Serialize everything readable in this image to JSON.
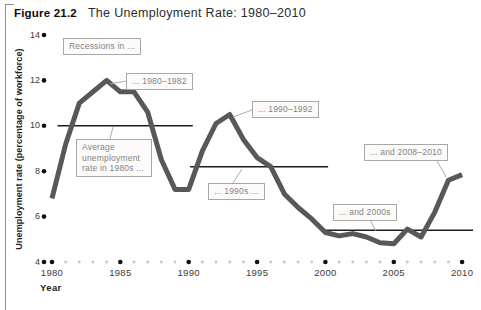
{
  "figure": {
    "label": "Figure 21.2",
    "title": "The Unemployment Rate: 1980–2010"
  },
  "axes": {
    "y_label": "Unemployment rate (percentage of workforce)",
    "x_label": "Year",
    "y_ticks": [
      14,
      12,
      10,
      8,
      6,
      4
    ],
    "x_ticks": [
      1980,
      1985,
      1990,
      1995,
      2000,
      2005,
      2010
    ]
  },
  "chart_data": {
    "type": "line",
    "title": "The Unemployment Rate: 1980–2010",
    "xlabel": "Year",
    "ylabel": "Unemployment rate (percentage of workforce)",
    "xlim": [
      1980,
      2010
    ],
    "ylim": [
      4,
      14
    ],
    "grid": false,
    "x": [
      1980,
      1981,
      1982,
      1983,
      1984,
      1985,
      1986,
      1987,
      1988,
      1989,
      1990,
      1991,
      1992,
      1993,
      1994,
      1995,
      1996,
      1997,
      1998,
      1999,
      2000,
      2001,
      2002,
      2003,
      2004,
      2005,
      2006,
      2007,
      2008,
      2009,
      2010
    ],
    "values": [
      6.8,
      9.2,
      11.0,
      11.5,
      12.0,
      11.5,
      11.5,
      10.6,
      8.5,
      7.2,
      7.2,
      8.9,
      10.1,
      10.5,
      9.4,
      8.6,
      8.2,
      7.0,
      6.4,
      5.9,
      5.3,
      5.15,
      5.25,
      5.1,
      4.85,
      4.8,
      5.45,
      5.1,
      6.2,
      7.6,
      7.85
    ],
    "average_lines": [
      {
        "id": "avg-1980s",
        "value": 10.0,
        "from": 1980.4,
        "to": 1990.3
      },
      {
        "id": "avg-1990s",
        "value": 8.2,
        "from": 1990.1,
        "to": 2000.2
      },
      {
        "id": "avg-2000s",
        "value": 5.4,
        "from": 2000.0,
        "to": 2010.8
      }
    ],
    "annotations": [
      {
        "id": "recessions-header",
        "text": "Recessions in ...",
        "x": 63,
        "y": 38
      },
      {
        "id": "recession-1980-1982",
        "text": "... 1980–1982",
        "x": 126,
        "y": 73,
        "leader": [
          126,
          81,
          110,
          84
        ]
      },
      {
        "id": "avg-1980s-label",
        "text": "Average unemployment rate in 1980s ...",
        "x": 76,
        "y": 139,
        "w": 76,
        "leader": [
          110,
          139,
          113,
          127
        ]
      },
      {
        "id": "recession-1990-1992",
        "text": "... 1990–1992",
        "x": 252,
        "y": 101,
        "leader": [
          252,
          110,
          233,
          117
        ]
      },
      {
        "id": "avg-1990s-label",
        "text": "... 1990s ...",
        "x": 208,
        "y": 183,
        "leader": [
          233,
          183,
          242,
          169
        ]
      },
      {
        "id": "avg-2000s-label",
        "text": "... and 2000s",
        "x": 333,
        "y": 204,
        "leader": [
          370,
          220,
          376,
          231
        ]
      },
      {
        "id": "recession-2008-2010",
        "text": "... and 2008–2010",
        "x": 364,
        "y": 144,
        "leader": [
          437,
          161,
          446,
          177
        ]
      }
    ]
  },
  "colors": {
    "curve": "#585858",
    "avg_line": "#1c1c1c",
    "tick_dot": "#111111",
    "minor_tick_dot": "#c9c6c1",
    "leader": "#acacac"
  }
}
